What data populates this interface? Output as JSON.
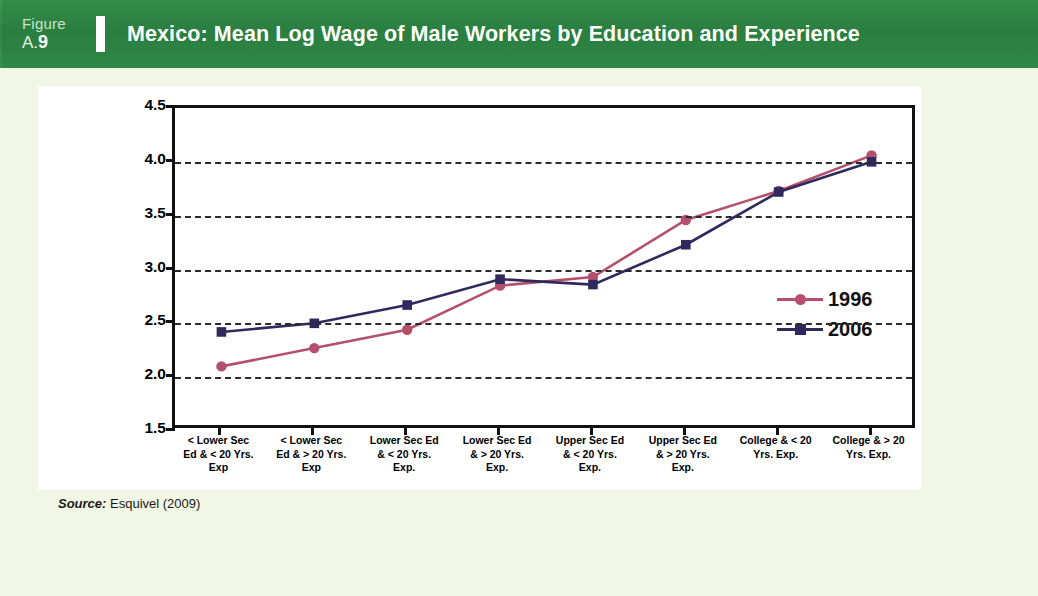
{
  "header": {
    "figure_word": "Figure",
    "figure_number_prefix": "A.",
    "figure_number": "9",
    "title": "Mexico: Mean Log Wage of Male Workers by Education and Experience",
    "band_color": "#2e8b45"
  },
  "source": {
    "label": "Source:",
    "text": " Esquivel (2009)"
  },
  "page": {
    "background_color": "#f2f6e4",
    "panel_color": "#ffffff"
  },
  "chart_data": {
    "type": "line",
    "title": "Mexico: Mean Log Wage of Male Workers by Education and Experience",
    "xlabel": "",
    "ylabel": "",
    "ylim": [
      1.5,
      4.5
    ],
    "yticks": [
      "1.5",
      "2.0",
      "2.5",
      "3.0",
      "3.5",
      "4.0",
      "4.5"
    ],
    "grid": true,
    "grid_style": "dashed-horizontal",
    "legend_position": "center-right-inside",
    "categories": [
      "< Lower Sec Ed & < 20 Yrs. Exp",
      "< Lower Sec Ed & > 20 Yrs. Exp",
      "Lower Sec Ed & < 20 Yrs. Exp.",
      "Lower Sec Ed & > 20 Yrs. Exp.",
      "Upper Sec Ed & < 20 Yrs. Exp.",
      "Upper Sec Ed & > 20 Yrs. Exp.",
      "College & < 20 Yrs. Exp.",
      "College & > 20 Yrs. Exp."
    ],
    "category_lines": [
      [
        "< Lower Sec",
        "Ed & < 20 Yrs.",
        "Exp"
      ],
      [
        "< Lower Sec",
        "Ed & > 20 Yrs.",
        "Exp"
      ],
      [
        "Lower Sec Ed",
        "& < 20 Yrs.",
        "Exp."
      ],
      [
        "Lower Sec Ed",
        "& > 20 Yrs.",
        "Exp."
      ],
      [
        "Upper Sec Ed",
        "& < 20 Yrs.",
        "Exp."
      ],
      [
        "Upper Sec Ed",
        "& > 20 Yrs.",
        "Exp."
      ],
      [
        "College & < 20",
        "Yrs. Exp.",
        ""
      ],
      [
        "College & > 20",
        "Yrs. Exp.",
        ""
      ]
    ],
    "series": [
      {
        "name": "1996",
        "color": "#b4506b",
        "marker": "circle",
        "values": [
          2.1,
          2.27,
          2.44,
          2.85,
          2.93,
          3.46,
          3.73,
          4.06
        ]
      },
      {
        "name": "2006",
        "color": "#2e2a5e",
        "marker": "square",
        "values": [
          2.42,
          2.5,
          2.67,
          2.91,
          2.86,
          3.23,
          3.72,
          4.0
        ]
      }
    ]
  }
}
